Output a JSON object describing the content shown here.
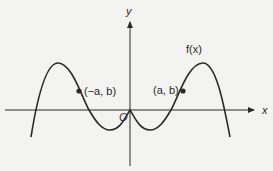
{
  "diagram": {
    "axes": {
      "x_label": "x",
      "y_label": "y",
      "origin_label": "O"
    },
    "function_label": "f(x)",
    "points": [
      {
        "label": "(−a, b)",
        "name": "point-neg-a-b"
      },
      {
        "label": "(a, b)",
        "name": "point-a-b"
      }
    ],
    "colors": {
      "line": "#2a2a2a",
      "background": "#f3f3f1"
    }
  }
}
